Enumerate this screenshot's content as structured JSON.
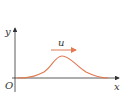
{
  "diagram": {
    "axes": {
      "x_label": "x",
      "y_label": "y",
      "origin_label": "O"
    },
    "wave": {
      "velocity_label": "u",
      "direction": "+x",
      "color": "#e07a52"
    },
    "colors": {
      "axis": "#333333",
      "wave": "#e07a52",
      "arrow": "#e07a52"
    }
  }
}
